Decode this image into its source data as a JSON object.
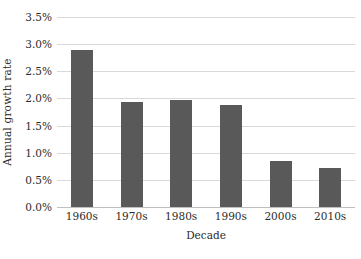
{
  "chart_data": {
    "type": "bar",
    "title": "",
    "subtitle": "",
    "xlabel": "Decade",
    "ylabel": "Annual growth rate",
    "categories": [
      "1960s",
      "1970s",
      "1980s",
      "1990s",
      "2000s",
      "2010s"
    ],
    "values": [
      2.89,
      1.94,
      1.97,
      1.88,
      0.84,
      0.71
    ],
    "value_unit": "%",
    "ylim": [
      0.0,
      3.5
    ],
    "ytick_values": [
      3.5,
      3.0,
      2.5,
      2.0,
      1.5,
      1.0,
      0.5,
      0.0
    ],
    "ytick_labels": [
      "3.5%",
      "3.0%",
      "2.5%",
      "2.0%",
      "1.5%",
      "1.0%",
      "0.5%",
      "0.0%"
    ],
    "grid": true,
    "grid_axis": "y",
    "legend": false,
    "legend_position": "none",
    "bar_color": "#595959",
    "grid_color": "#d9d9d9",
    "axis_color": "#bfbfbf",
    "text_color": "#2b2b2b",
    "background_color": "#ffffff",
    "annotations": []
  }
}
